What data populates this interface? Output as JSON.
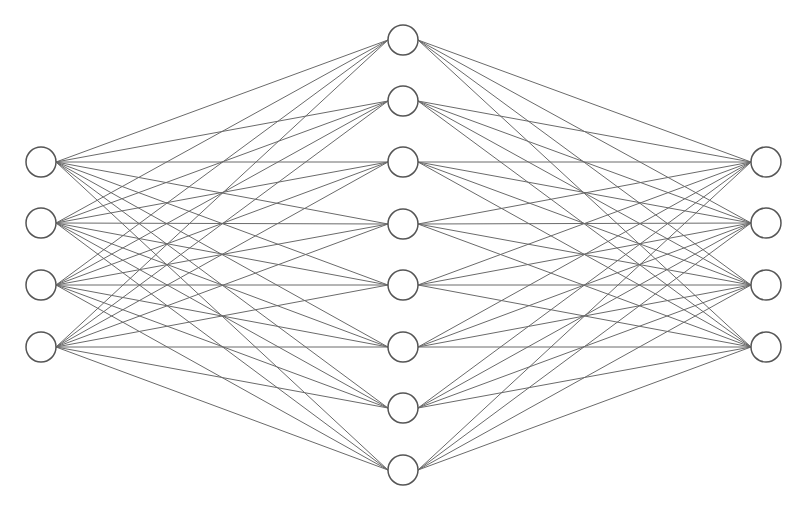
{
  "diagram": {
    "type": "neural-network",
    "colors": {
      "edge": "#6a6a6a",
      "node_stroke": "#555555",
      "node_fill": "#ffffff",
      "background": "#ffffff"
    },
    "node_radius": 15,
    "layers": [
      {
        "name": "input",
        "x": 41,
        "nodes_y": [
          162,
          223,
          285,
          347
        ]
      },
      {
        "name": "hidden",
        "x": 403,
        "nodes_y": [
          40,
          101,
          162,
          224,
          285,
          347,
          408,
          470
        ]
      },
      {
        "name": "output",
        "x": 766,
        "nodes_y": [
          162,
          223,
          285,
          347
        ]
      }
    ],
    "connectivity": "fully-connected"
  }
}
